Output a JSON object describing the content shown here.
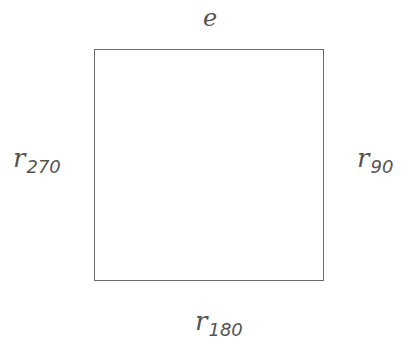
{
  "diagram": {
    "type": "square with labeled sides (symmetry/rotation diagram)",
    "shape": "square",
    "labels": {
      "top": {
        "main": "e",
        "sub": ""
      },
      "right": {
        "main": "r",
        "sub": "90"
      },
      "bottom": {
        "main": "r",
        "sub": "180"
      },
      "left": {
        "main": "r",
        "sub": "270"
      }
    },
    "colors": {
      "stroke": "#6a6a6a",
      "text": "#555555",
      "background": "#ffffff"
    }
  }
}
